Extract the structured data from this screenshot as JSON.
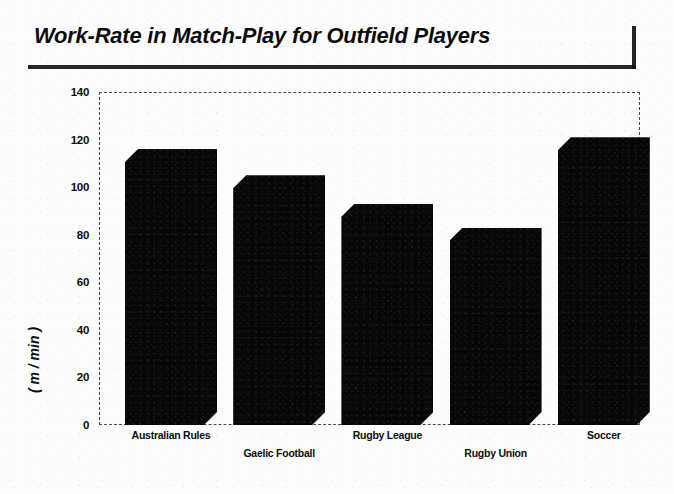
{
  "title": {
    "text": "Work-Rate in Match-Play for Outfield Players"
  },
  "chart_data": {
    "type": "bar",
    "title": "Work-Rate in Match-Play for Outfield Players",
    "xlabel": "",
    "ylabel": "( m / min )",
    "ylim": [
      0,
      140
    ],
    "yticks": [
      0,
      20,
      40,
      60,
      80,
      100,
      120,
      140
    ],
    "ytick_labels": [
      "0",
      "20",
      "40",
      "60",
      "80",
      "100",
      "120",
      "140"
    ],
    "grid": false,
    "legend": "none",
    "categories": [
      "Australian Rules",
      "Gaelic Football",
      "Rugby League",
      "Rugby Union",
      "Soccer"
    ],
    "values": [
      116,
      105,
      93,
      83,
      121
    ],
    "bar_color": "#070707",
    "frame_color": "#4a4a4a",
    "background": "#fdfdfd"
  }
}
